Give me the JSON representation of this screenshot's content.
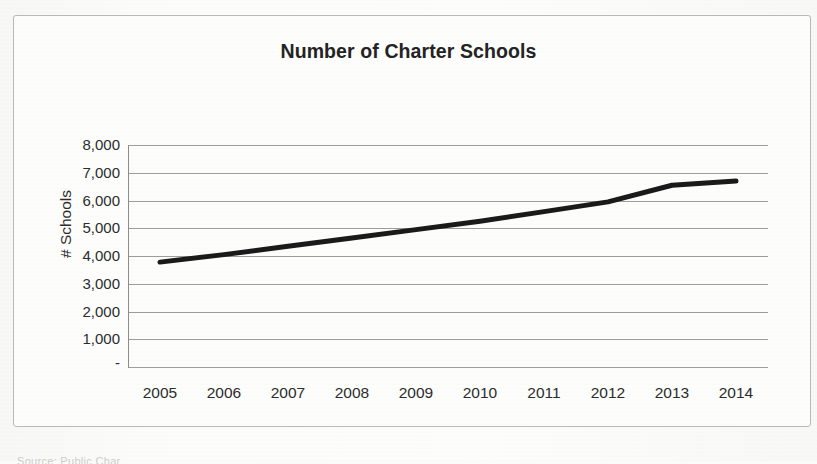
{
  "chart_data": {
    "type": "line",
    "title": "Number of Charter Schools",
    "xlabel": "",
    "ylabel": "# Schools",
    "categories": [
      "2005",
      "2006",
      "2007",
      "2008",
      "2009",
      "2010",
      "2011",
      "2012",
      "2013",
      "2014"
    ],
    "x": [
      2005,
      2006,
      2007,
      2008,
      2009,
      2010,
      2011,
      2012,
      2013,
      2014
    ],
    "values": [
      3780,
      4050,
      4350,
      4650,
      4950,
      5250,
      5600,
      5950,
      6550,
      6700
    ],
    "series": [
      {
        "name": "Number of Charter Schools",
        "values": [
          3780,
          4050,
          4350,
          4650,
          4950,
          5250,
          5600,
          5950,
          6550,
          6700
        ],
        "color": "#1a1a1a",
        "line_width": 5
      }
    ],
    "ylim": [
      0,
      8000
    ],
    "ytick_values": [
      0,
      1000,
      2000,
      3000,
      4000,
      5000,
      6000,
      7000,
      8000
    ],
    "ytick_labels": [
      "-",
      "1,000",
      "2,000",
      "3,000",
      "4,000",
      "5,000",
      "6,000",
      "7,000",
      "8,000"
    ],
    "grid": true,
    "grid_color": "#9e9e9b",
    "legend": false,
    "legend_position": "none"
  },
  "chart": {
    "title": "Number of Charter Schools",
    "y_axis_title": "# Schools",
    "y_tick_labels": [
      "8,000",
      "7,000",
      "6,000",
      "5,000",
      "4,000",
      "3,000",
      "2,000",
      "1,000",
      "-"
    ],
    "x_tick_labels": [
      "2005",
      "2006",
      "2007",
      "2008",
      "2009",
      "2010",
      "2011",
      "2012",
      "2013",
      "2014"
    ],
    "line_color": "#1a1a1a",
    "grid_color": "#9e9e9b",
    "frame_color": "#b9b9b6",
    "background_color": "#fdfdfc"
  },
  "footer": {
    "source_text": "Source: Public Char"
  }
}
